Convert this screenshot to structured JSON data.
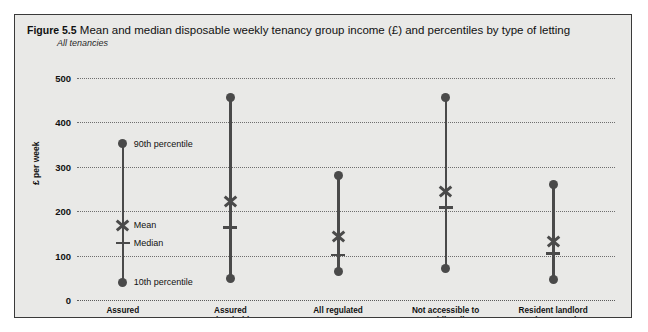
{
  "figure": {
    "number": "Figure 5.5",
    "title": "Mean and median disposable weekly tenancy group income (£) and percentiles by type of letting",
    "subtitle": "All tenancies"
  },
  "chart_data": {
    "type": "scatter",
    "title": "Mean and median disposable weekly tenancy group income (£) and percentiles by type of letting",
    "subtitle": "All tenancies",
    "xlabel": "",
    "ylabel": "£ per week",
    "ylim": [
      0,
      500
    ],
    "yticks": [
      0,
      100,
      200,
      300,
      400,
      500
    ],
    "ytick_labels": [
      "0",
      "100",
      "200",
      "300",
      "400",
      "500"
    ],
    "grid": true,
    "legend": "none",
    "categories": [
      "Assured",
      "Assured\nshorthold",
      "All regulated",
      "Not accessible to\npublic, all",
      "Resident landlord\nand no security"
    ],
    "series": [
      {
        "name": "10th percentile",
        "values": [
          40,
          48,
          65,
          70,
          47
        ]
      },
      {
        "name": "Median",
        "values": [
          129,
          163,
          101,
          208,
          105
        ]
      },
      {
        "name": "Mean",
        "values": [
          170,
          222,
          145,
          245,
          132
        ]
      },
      {
        "name": "90th percentile",
        "values": [
          352,
          457,
          281,
          457,
          260
        ]
      }
    ],
    "annotations": [
      {
        "text": "90th percentile",
        "category": "Assured",
        "value": 352
      },
      {
        "text": "Mean",
        "category": "Assured",
        "value": 170
      },
      {
        "text": "Median",
        "category": "Assured",
        "value": 129
      },
      {
        "text": "10th percentile",
        "category": "Assured",
        "value": 40
      }
    ],
    "marker_styles": {
      "percentile": "filled-circle",
      "mean": "x-cross",
      "median": "horizontal-dash"
    },
    "colors": {
      "panel_background": "#e9e9e7",
      "marker": "#4a4a4a",
      "gridline": "#6e6e6e",
      "text": "#111111",
      "border": "#3a3a3a"
    }
  }
}
